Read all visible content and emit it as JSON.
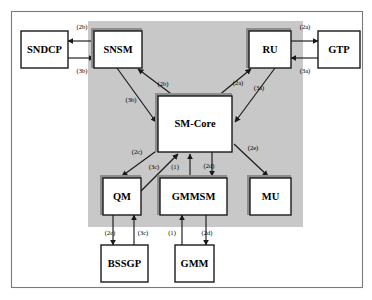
{
  "diagram": {
    "colors": {
      "panel_fill": "#c8c8c8",
      "box_fill": "#ffffff",
      "box_stroke": "#1a1a1a",
      "shadow": "#8d8d8d",
      "outer_border": "#7a7a7a"
    },
    "panel": {
      "x": 88,
      "y": 21,
      "w": 215,
      "h": 206
    },
    "outer": {
      "x": 11,
      "y": 11,
      "w": 352,
      "h": 277
    },
    "nodes": [
      {
        "id": "sndcp",
        "label": "SNDCP",
        "x": 21,
        "y": 31,
        "w": 47,
        "h": 37,
        "inside_panel": false,
        "shadow": false
      },
      {
        "id": "snsm",
        "label": "SNSM",
        "x": 94,
        "y": 31,
        "w": 48,
        "h": 37,
        "inside_panel": true,
        "shadow": true
      },
      {
        "id": "ru",
        "label": "RU",
        "x": 249,
        "y": 31,
        "w": 42,
        "h": 37,
        "inside_panel": true,
        "shadow": true
      },
      {
        "id": "gtp",
        "label": "GTP",
        "x": 318,
        "y": 31,
        "w": 42,
        "h": 37,
        "inside_panel": false,
        "shadow": false
      },
      {
        "id": "smcore",
        "label": "SM-Core",
        "x": 158,
        "y": 96,
        "w": 74,
        "h": 56,
        "inside_panel": true,
        "shadow": true
      },
      {
        "id": "qm",
        "label": "QM",
        "x": 103,
        "y": 178,
        "w": 38,
        "h": 37,
        "inside_panel": true,
        "shadow": true
      },
      {
        "id": "gmmsm",
        "label": "GMMSM",
        "x": 160,
        "y": 178,
        "w": 67,
        "h": 37,
        "inside_panel": true,
        "shadow": true
      },
      {
        "id": "mu",
        "label": "MU",
        "x": 250,
        "y": 178,
        "w": 41,
        "h": 37,
        "inside_panel": true,
        "shadow": true
      },
      {
        "id": "bssgp",
        "label": "BSSGP",
        "x": 101,
        "y": 245,
        "w": 47,
        "h": 37,
        "inside_panel": false,
        "shadow": false
      },
      {
        "id": "gmm",
        "label": "GMM",
        "x": 175,
        "y": 245,
        "w": 39,
        "h": 37,
        "inside_panel": false,
        "shadow": false
      }
    ],
    "edges": [
      {
        "id": "e-snsm-sndcp",
        "label": "(2b)",
        "from": "snsm",
        "to": "sndcp",
        "label_x": 82,
        "label_y": 27
      },
      {
        "id": "e-sndcp-snsm",
        "label": "(3b)",
        "from": "sndcp",
        "to": "snsm",
        "label_x": 82,
        "label_y": 71
      },
      {
        "id": "e-ru-gtp",
        "label": "(2a)",
        "from": "ru",
        "to": "gtp",
        "label_x": 305,
        "label_y": 27
      },
      {
        "id": "e-gtp-ru",
        "label": "(3a)",
        "from": "gtp",
        "to": "ru",
        "label_x": 305,
        "label_y": 71
      },
      {
        "id": "e-snsm-smcore",
        "label": "(3b)",
        "from": "snsm",
        "to": "smcore",
        "label_x": 131,
        "label_y": 100
      },
      {
        "id": "e-smcore-snsm",
        "label": "(2b)",
        "from": "smcore",
        "to": "snsm",
        "label_x": 163,
        "label_y": 84
      },
      {
        "id": "e-smcore-ru",
        "label": "(2a)",
        "from": "smcore",
        "to": "ru",
        "label_x": 238,
        "label_y": 83
      },
      {
        "id": "e-ru-smcore",
        "label": "(3a)",
        "from": "ru",
        "to": "smcore",
        "label_x": 259,
        "label_y": 88
      },
      {
        "id": "e-smcore-qm",
        "label": "(2c)",
        "from": "smcore",
        "to": "qm",
        "label_x": 137,
        "label_y": 152
      },
      {
        "id": "e-qm-smcore",
        "label": "(3c)",
        "from": "qm",
        "to": "smcore",
        "label_x": 154,
        "label_y": 167
      },
      {
        "id": "e-gmmsm-smcore",
        "label": "(1)",
        "from": "gmmsm",
        "to": "smcore",
        "label_x": 175,
        "label_y": 167
      },
      {
        "id": "e-smcore-gmmsm",
        "label": "(2d)",
        "from": "smcore",
        "to": "gmmsm",
        "label_x": 209,
        "label_y": 166
      },
      {
        "id": "e-smcore-mu",
        "label": "(2e)",
        "from": "smcore",
        "to": "mu",
        "label_x": 253,
        "label_y": 148
      },
      {
        "id": "e-qm-bssgp",
        "label": "(2c)",
        "from": "qm",
        "to": "bssgp",
        "label_x": 110,
        "label_y": 233
      },
      {
        "id": "e-bssgp-qm",
        "label": "(3c)",
        "from": "bssgp",
        "to": "qm",
        "label_x": 143,
        "label_y": 233
      },
      {
        "id": "e-gmm-gmmsm",
        "label": "(1)",
        "from": "gmm",
        "to": "gmmsm",
        "label_x": 172,
        "label_y": 233
      },
      {
        "id": "e-gmmsm-gmm",
        "label": "(2d)",
        "from": "gmmsm",
        "to": "gmm",
        "label_x": 207,
        "label_y": 233
      }
    ]
  }
}
